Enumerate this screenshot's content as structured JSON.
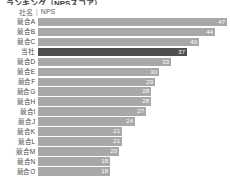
{
  "title_strip": "ランキング（NPSスコア）",
  "header": {
    "name_label": "社名",
    "separator": "|",
    "value_label": "NPS"
  },
  "colors": {
    "bar": "#a8a8a8",
    "bar_self": "#4f4f4f",
    "value_text": "#ffffff",
    "label_text": "#3f4447",
    "background": "#ffffff"
  },
  "chart_data": {
    "type": "bar",
    "orientation": "horizontal",
    "title": "ランキング（NPSスコア）",
    "xlabel": "NPS",
    "ylabel": "社名",
    "grid": false,
    "legend": false,
    "xlim": [
      0,
      47
    ],
    "categories": [
      "競合A",
      "競合B",
      "競合C",
      "当社",
      "競合D",
      "競合E",
      "競合F",
      "競合G",
      "競合H",
      "競合I",
      "競合J",
      "競合K",
      "競合L",
      "競合M",
      "競合N",
      "競合O"
    ],
    "values": [
      47,
      44,
      40,
      37,
      33,
      30,
      29,
      28,
      28,
      27,
      24,
      21,
      21,
      20,
      18,
      18
    ],
    "highlight_index": 3,
    "rows": [
      {
        "label": "競合A",
        "value": 47,
        "value_text": "47",
        "pct": 100.0,
        "self": false
      },
      {
        "label": "競合B",
        "value": 44,
        "value_text": "44",
        "pct": 93.6,
        "self": false
      },
      {
        "label": "競合C",
        "value": 40,
        "value_text": "40",
        "pct": 85.1,
        "self": false
      },
      {
        "label": "当社",
        "value": 37,
        "value_text": "37",
        "pct": 78.7,
        "self": true
      },
      {
        "label": "競合D",
        "value": 33,
        "value_text": "33",
        "pct": 70.2,
        "self": false
      },
      {
        "label": "競合E",
        "value": 30,
        "value_text": "30",
        "pct": 63.8,
        "self": false
      },
      {
        "label": "競合F",
        "value": 29,
        "value_text": "29",
        "pct": 61.7,
        "self": false
      },
      {
        "label": "競合G",
        "value": 28,
        "value_text": "28",
        "pct": 59.6,
        "self": false
      },
      {
        "label": "競合H",
        "value": 28,
        "value_text": "28",
        "pct": 59.6,
        "self": false
      },
      {
        "label": "競合I",
        "value": 27,
        "value_text": "27",
        "pct": 57.4,
        "self": false
      },
      {
        "label": "競合J",
        "value": 24,
        "value_text": "24",
        "pct": 51.1,
        "self": false
      },
      {
        "label": "競合K",
        "value": 21,
        "value_text": "21",
        "pct": 44.7,
        "self": false
      },
      {
        "label": "競合L",
        "value": 21,
        "value_text": "21",
        "pct": 44.7,
        "self": false
      },
      {
        "label": "競合M",
        "value": 20,
        "value_text": "20",
        "pct": 42.6,
        "self": false
      },
      {
        "label": "競合N",
        "value": 18,
        "value_text": "18",
        "pct": 38.3,
        "self": false
      },
      {
        "label": "競合O",
        "value": 18,
        "value_text": "18",
        "pct": 38.3,
        "self": false
      }
    ]
  }
}
